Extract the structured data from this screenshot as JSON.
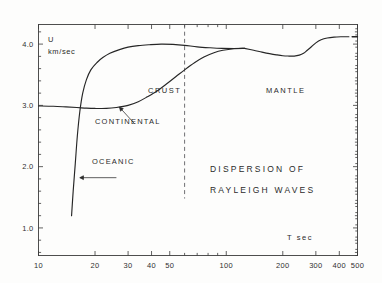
{
  "figure": {
    "caption_lines": [
      "DISPERSION  OF",
      "RAYLEIGH  WAVES"
    ]
  },
  "axes": {
    "y_name_line1": "U",
    "y_name_line2": "km/sec",
    "x_name": "T  sec"
  },
  "annotations": {
    "crust": "CRUST",
    "mantle": "MANTLE",
    "continental": "CONTINENTAL",
    "oceanic": "OCEANIC"
  },
  "chart_data": {
    "type": "line",
    "title": "DISPERSION OF RAYLEIGH WAVES",
    "xlabel": "T  sec",
    "ylabel": "U  km/sec",
    "xscale": "log",
    "yscale": "linear",
    "xlim": [
      10,
      500
    ],
    "ylim": [
      0.55,
      4.32
    ],
    "grid": false,
    "legend": "none",
    "xticks_major": [
      10,
      20,
      30,
      40,
      50,
      100,
      200,
      300,
      400,
      500
    ],
    "xtick_labels": [
      "10",
      "20",
      "30",
      "40",
      "50",
      "100",
      "200",
      "300",
      "400",
      "500"
    ],
    "yticks_major": [
      1.0,
      2.0,
      3.0,
      4.0
    ],
    "ytick_labels": [
      "1.0",
      "2.0",
      "3.0",
      "4.0"
    ],
    "ytick_minor_step": 0.2,
    "divider": {
      "type": "vertical-dashed",
      "x": 60,
      "label_left": "CRUST",
      "label_right": "MANTLE"
    },
    "series": [
      {
        "name": "CONTINENTAL",
        "points": [
          [
            10.0,
            2.99
          ],
          [
            12.0,
            2.985
          ],
          [
            14.0,
            2.975
          ],
          [
            16.0,
            2.965
          ],
          [
            18.0,
            2.955
          ],
          [
            20.0,
            2.95
          ],
          [
            23.0,
            2.95
          ],
          [
            26.0,
            2.965
          ],
          [
            30.0,
            3.0
          ],
          [
            34.0,
            3.06
          ],
          [
            38.0,
            3.14
          ],
          [
            43.0,
            3.24
          ],
          [
            48.0,
            3.35
          ],
          [
            54.0,
            3.47
          ],
          [
            60.0,
            3.58
          ],
          [
            68.0,
            3.7
          ],
          [
            76.0,
            3.79
          ],
          [
            86.0,
            3.86
          ],
          [
            96.0,
            3.9
          ],
          [
            110.0,
            3.925
          ],
          [
            125.0,
            3.93
          ]
        ]
      },
      {
        "name": "OCEANIC",
        "points": [
          [
            15.0,
            1.2
          ],
          [
            15.3,
            1.6
          ],
          [
            15.7,
            2.05
          ],
          [
            16.1,
            2.5
          ],
          [
            16.6,
            2.9
          ],
          [
            17.2,
            3.2
          ],
          [
            18.0,
            3.42
          ],
          [
            19.0,
            3.58
          ],
          [
            20.5,
            3.7
          ],
          [
            22.0,
            3.78
          ],
          [
            24.0,
            3.85
          ],
          [
            27.0,
            3.91
          ],
          [
            30.0,
            3.95
          ],
          [
            34.0,
            3.975
          ],
          [
            39.0,
            3.99
          ],
          [
            45.0,
            4.0
          ],
          [
            52.0,
            3.995
          ],
          [
            60.0,
            3.98
          ],
          [
            70.0,
            3.955
          ],
          [
            82.0,
            3.94
          ],
          [
            95.0,
            3.93
          ],
          [
            110.0,
            3.928
          ],
          [
            125.0,
            3.93
          ]
        ]
      },
      {
        "name": "MANTLE-BRANCH",
        "points": [
          [
            125.0,
            3.93
          ],
          [
            140.0,
            3.9
          ],
          [
            155.0,
            3.87
          ],
          [
            170.0,
            3.845
          ],
          [
            185.0,
            3.825
          ],
          [
            200.0,
            3.81
          ],
          [
            215.0,
            3.805
          ],
          [
            230.0,
            3.805
          ],
          [
            245.0,
            3.82
          ],
          [
            258.0,
            3.85
          ],
          [
            270.0,
            3.9
          ],
          [
            285.0,
            3.96
          ],
          [
            300.0,
            4.02
          ],
          [
            320.0,
            4.07
          ],
          [
            345.0,
            4.1
          ],
          [
            375.0,
            4.115
          ],
          [
            410.0,
            4.12
          ],
          [
            450.0,
            4.12
          ]
        ]
      },
      {
        "name": "END-DASH",
        "points": [
          [
            468.0,
            4.12
          ],
          [
            500.0,
            4.12
          ]
        ]
      }
    ],
    "callouts": [
      {
        "label": "CONTINENTAL",
        "points_to": [
          27.0,
          2.97
        ]
      },
      {
        "label": "OCEANIC",
        "points_to": [
          16.2,
          1.82
        ]
      }
    ]
  }
}
